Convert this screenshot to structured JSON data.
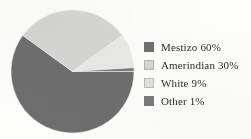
{
  "chart_data": {
    "type": "pie",
    "title": "",
    "subtitle": "",
    "xlabel": "",
    "ylabel": "",
    "legend_position": "right",
    "grid": false,
    "categories": [
      "Mestizo",
      "Amerindian",
      "White",
      "Other"
    ],
    "values": [
      60,
      30,
      9,
      1
    ],
    "value_unit": "%",
    "slices": [
      {
        "label": "Mestizo",
        "value": 60,
        "value_text": "60%",
        "legend_text": "Mestizo 60%",
        "color": "#6e6e6e",
        "start_angle": 0,
        "end_angle": 216
      },
      {
        "label": "Amerindian",
        "value": 30,
        "value_text": "30%",
        "legend_text": "Amerindian 30%",
        "color": "#d6d6d4",
        "start_angle": 216,
        "end_angle": 324
      },
      {
        "label": "White",
        "value": 9,
        "value_text": "9%",
        "legend_text": "White 9%",
        "color": "#e9e9e7",
        "start_angle": 324,
        "end_angle": 356.4
      },
      {
        "label": "Other",
        "value": 1,
        "value_text": "1%",
        "legend_text": "Other 1%",
        "color": "#7a7a7a",
        "start_angle": 356.4,
        "end_angle": 360
      }
    ]
  },
  "legend": {
    "items": [
      {
        "label": "Mestizo 60%",
        "color": "#6e6e6e"
      },
      {
        "label": "Amerindian 30%",
        "color": "#d6d6d4"
      },
      {
        "label": "White 9%",
        "color": "#e2e2e0"
      },
      {
        "label": "Other 1%",
        "color": "#7a7a7a"
      }
    ]
  },
  "colors": {
    "background": "#fdfdfb",
    "text": "#2f2d2b",
    "mestizo": "#6e6e6e",
    "amerindian": "#d6d6d4",
    "white": "#e9e9e7",
    "other": "#7a7a7a"
  }
}
